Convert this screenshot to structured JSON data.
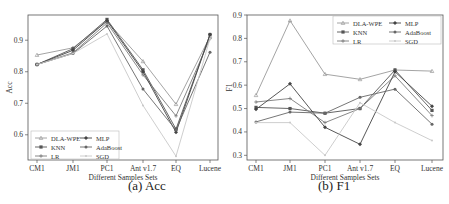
{
  "chart_data": [
    {
      "type": "line",
      "title": "",
      "caption": "(a) Acc",
      "xlabel": "Different Samples Sets",
      "ylabel": "Acc",
      "categories": [
        "CM1",
        "JM1",
        "PC1",
        "Ant v1.7",
        "EQ",
        "Lucene"
      ],
      "ylim": [
        0.52,
        0.98
      ],
      "yticks": [
        0.6,
        0.7,
        0.8,
        0.9
      ],
      "grid": false,
      "legend_position": "lower left",
      "series": [
        {
          "name": "DLA-WPE",
          "color": "#9a9a9a",
          "values": [
            0.853,
            0.876,
            0.96,
            0.833,
            0.697,
            0.912
          ]
        },
        {
          "name": "KNN",
          "color": "#555555",
          "values": [
            0.823,
            0.873,
            0.966,
            0.806,
            0.618,
            0.918
          ]
        },
        {
          "name": "LR",
          "color": "#7a7a7a",
          "values": [
            0.823,
            0.86,
            0.955,
            0.79,
            0.66,
            0.905
          ]
        },
        {
          "name": "MLP",
          "color": "#444444",
          "values": [
            0.823,
            0.868,
            0.962,
            0.8,
            0.608,
            0.918
          ]
        },
        {
          "name": "AdaBoost",
          "color": "#666666",
          "values": [
            0.823,
            0.858,
            0.945,
            0.745,
            0.615,
            0.862
          ]
        },
        {
          "name": "SGD",
          "color": "#c8c8c8",
          "values": [
            0.823,
            0.858,
            0.92,
            0.693,
            0.532,
            0.905
          ]
        }
      ]
    },
    {
      "type": "line",
      "title": "",
      "caption": "(b) F1",
      "xlabel": "Different Samples Sets",
      "ylabel": "F1",
      "categories": [
        "CM1",
        "JM1",
        "PC1",
        "Ant v1.7",
        "EQ",
        "Lucene"
      ],
      "ylim": [
        0.28,
        0.9
      ],
      "yticks": [
        0.3,
        0.4,
        0.5,
        0.6,
        0.7,
        0.8,
        0.9
      ],
      "grid": false,
      "legend_position": "upper right",
      "series": [
        {
          "name": "DLA-WPE",
          "color": "#9a9a9a",
          "values": [
            0.557,
            0.876,
            0.647,
            0.625,
            0.665,
            0.66
          ]
        },
        {
          "name": "KNN",
          "color": "#555555",
          "values": [
            0.505,
            0.5,
            0.48,
            0.5,
            0.665,
            0.492
          ]
        },
        {
          "name": "LR",
          "color": "#7a7a7a",
          "values": [
            0.528,
            0.543,
            0.44,
            0.5,
            0.64,
            0.47
          ]
        },
        {
          "name": "MLP",
          "color": "#444444",
          "values": [
            0.497,
            0.606,
            0.42,
            0.347,
            0.657,
            0.51
          ]
        },
        {
          "name": "AdaBoost",
          "color": "#666666",
          "values": [
            0.443,
            0.485,
            0.48,
            0.548,
            0.583,
            0.433
          ]
        },
        {
          "name": "SGD",
          "color": "#c8c8c8",
          "values": [
            0.44,
            0.44,
            0.3,
            0.525,
            0.44,
            0.363
          ]
        }
      ]
    }
  ]
}
